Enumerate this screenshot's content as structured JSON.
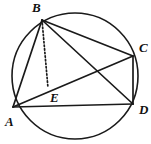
{
  "figure": {
    "kind": "cyclic-quadrilateral-diagram",
    "background_color": "#ffffff",
    "stroke_color": "#1a1a1a",
    "label_color": "#111111",
    "canvas": {
      "width": 151,
      "height": 144
    },
    "circle": {
      "name": "circumscribed-circle",
      "cx": 75,
      "cy": 76,
      "r": 63,
      "stroke_width": 1.6
    },
    "points": [
      {
        "id": "B",
        "label": "B",
        "x": 42,
        "y": 20,
        "label_x": 32,
        "label_y": 1
      },
      {
        "id": "C",
        "label": "C",
        "x": 133,
        "y": 56,
        "label_x": 139,
        "label_y": 41
      },
      {
        "id": "D",
        "label": "D",
        "x": 133,
        "y": 104,
        "label_x": 139,
        "label_y": 103
      },
      {
        "id": "A",
        "label": "A",
        "x": 13,
        "y": 107,
        "label_x": 5,
        "label_y": 115
      },
      {
        "id": "E",
        "label": "E",
        "x": 48,
        "y": 88,
        "label_x": 50,
        "label_y": 91
      }
    ],
    "segments": [
      {
        "name": "segment-ab",
        "from": "A",
        "to": "B",
        "style": "solid",
        "stroke_width": 1.7
      },
      {
        "name": "segment-bc",
        "from": "B",
        "to": "C",
        "style": "solid",
        "stroke_width": 1.7
      },
      {
        "name": "segment-cd",
        "from": "C",
        "to": "D",
        "style": "solid",
        "stroke_width": 1.7
      },
      {
        "name": "segment-ad",
        "from": "A",
        "to": "D",
        "style": "solid",
        "stroke_width": 1.7
      },
      {
        "name": "segment-bd",
        "from": "B",
        "to": "D",
        "style": "solid",
        "stroke_width": 1.7
      },
      {
        "name": "segment-ac",
        "from": "A",
        "to": "C",
        "style": "solid",
        "stroke_width": 1.7
      },
      {
        "name": "segment-be",
        "from": "B",
        "to": "E",
        "style": "dotted",
        "stroke_width": 1.7
      }
    ]
  }
}
